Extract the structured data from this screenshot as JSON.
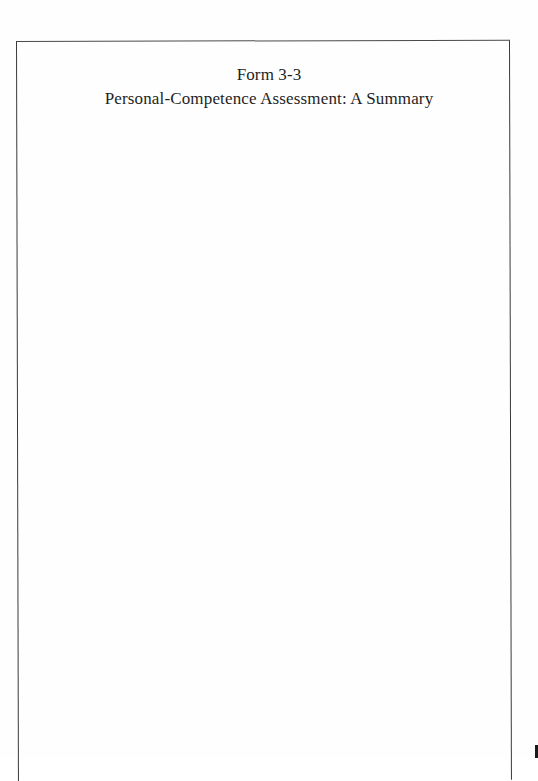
{
  "document": {
    "form_number": "Form 3-3",
    "form_title": "Personal-Competence Assessment: A Summary",
    "body_content": ""
  },
  "colors": {
    "page_background": "#fefefe",
    "frame_border": "#3a3a3a",
    "text": "#1e1e1e"
  }
}
